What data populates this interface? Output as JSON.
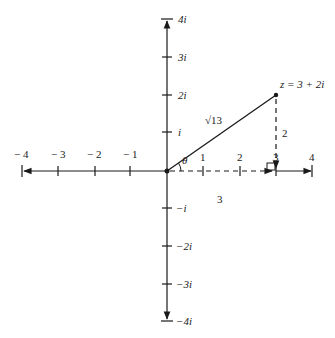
{
  "diagram": {
    "point_label": "z = 3 + 2i",
    "modulus_label": "√13",
    "angle_label": "θ",
    "horizontal_leg_label": "3",
    "vertical_leg_label": "2",
    "real_axis": {
      "ticks": [
        {
          "value": -4,
          "label": "− 4"
        },
        {
          "value": -3,
          "label": "− 3"
        },
        {
          "value": -2,
          "label": "− 2"
        },
        {
          "value": -1,
          "label": "− 1"
        },
        {
          "value": 1,
          "label": "1"
        },
        {
          "value": 2,
          "label": "2"
        },
        {
          "value": 3,
          "label": "3"
        },
        {
          "value": 4,
          "label": "4"
        }
      ]
    },
    "imaginary_axis": {
      "ticks": [
        {
          "value": 4,
          "label": "4i"
        },
        {
          "value": 3,
          "label": "3i"
        },
        {
          "value": 2,
          "label": "2i"
        },
        {
          "value": 1,
          "label": "i"
        },
        {
          "value": -1,
          "label": "−i"
        },
        {
          "value": -2,
          "label": "−2i"
        },
        {
          "value": -3,
          "label": "−3i"
        },
        {
          "value": -4,
          "label": "−4i"
        }
      ]
    },
    "colors": {
      "line": "#1a1a1a",
      "text": "#222222"
    }
  }
}
